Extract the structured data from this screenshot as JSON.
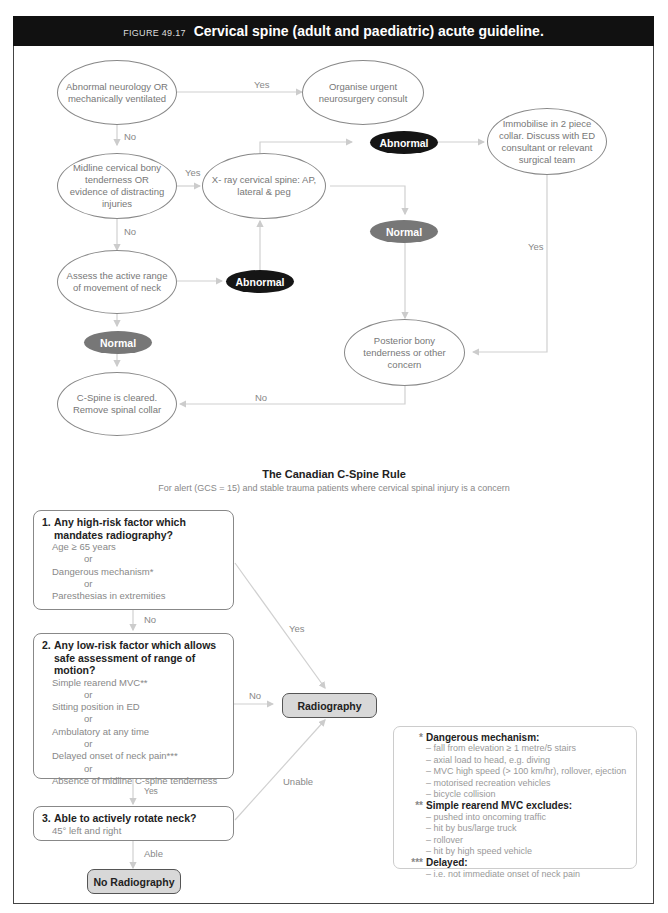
{
  "header": {
    "figure_number": "FIGURE 49.17",
    "title": "Cervical spine (adult and paediatric) acute guideline."
  },
  "flowchart": {
    "nodes": {
      "abnormal_neurology": "Abnormal neurology OR mechanically ventilated",
      "neurosurgery": "Organise urgent neurosurgery consult",
      "midline": "Midline cervical bony tenderness OR evidence of distracting injuries",
      "xray": "X- ray cervical spine: AP, lateral & peg",
      "immobilise": "Immobilise in 2 piece collar.  Discuss with ED consultant or relevant surgical team",
      "assess_rom": "Assess the active range of movement of neck",
      "posterior": "Posterior bony tenderness or other concern",
      "cleared": "C-Spine is cleared. Remove spinal collar"
    },
    "badges": {
      "abnormal_xray": "Abnormal",
      "normal_xray": "Normal",
      "abnormal_rom": "Abnormal",
      "normal_rom": "Normal"
    },
    "edge_labels": {
      "yes_neuro": "Yes",
      "no_neuro": "No",
      "yes_midline": "Yes",
      "no_midline": "No",
      "yes_posterior": "Yes",
      "no_posterior": "No"
    }
  },
  "canadian_rule": {
    "title": "The Canadian C-Spine Rule",
    "subtitle": "For alert (GCS = 15) and stable trauma patients where cervical spinal injury is a concern",
    "q1": {
      "number": "1.",
      "question_line1": "Any high-risk factor which",
      "question_line2": "mandates radiography?",
      "items": [
        "Age ≥ 65 years",
        "Dangerous mechanism*",
        "Paresthesias in extremities"
      ],
      "or": "or"
    },
    "q2": {
      "number": "2.",
      "question_line1": "Any low-risk factor which allows",
      "question_line2": "safe assessment of range of motion?",
      "items": [
        "Simple rearend MVC**",
        "Sitting position in ED",
        "Ambulatory at any time",
        "Delayed onset of neck pain***",
        "Absence of midline C-spine tenderness"
      ],
      "or": "or"
    },
    "q3": {
      "number": "3.",
      "question": "Able to actively rotate neck?",
      "detail": "45° left and right"
    },
    "results": {
      "radiography": "Radiography",
      "no_radiography": "No Radiography"
    },
    "edge_labels": {
      "q1_no": "No",
      "q1_yes": "Yes",
      "q2_no": "No",
      "q2_yes": "Yes",
      "q3_unable": "Unable",
      "q3_able": "Able"
    },
    "legend": {
      "dangerous": {
        "marker": "*",
        "heading": "Dangerous mechanism:",
        "items": [
          "fall from elevation ≥ 1 metre/5 stairs",
          "axial load to head, e.g. diving",
          "MVC high speed (> 100 km/hr), rollover, ejection",
          "motorised recreation vehicles",
          "bicycle collision"
        ]
      },
      "rearend": {
        "marker": "**",
        "heading": "Simple rearend MVC excludes:",
        "items": [
          "pushed into oncoming traffic",
          "hit by bus/large truck",
          "rollover",
          "hit by high speed vehicle"
        ]
      },
      "delayed": {
        "marker": "***",
        "heading": "Delayed:",
        "items": [
          "i.e. not immediate onset of neck pain"
        ]
      },
      "dash": "–"
    }
  },
  "colors": {
    "header_bg": "#111111",
    "abnormal_badge": "#151515",
    "normal_badge": "#777777",
    "result_fill": "#d8d8d8",
    "line": "#cccccc"
  }
}
